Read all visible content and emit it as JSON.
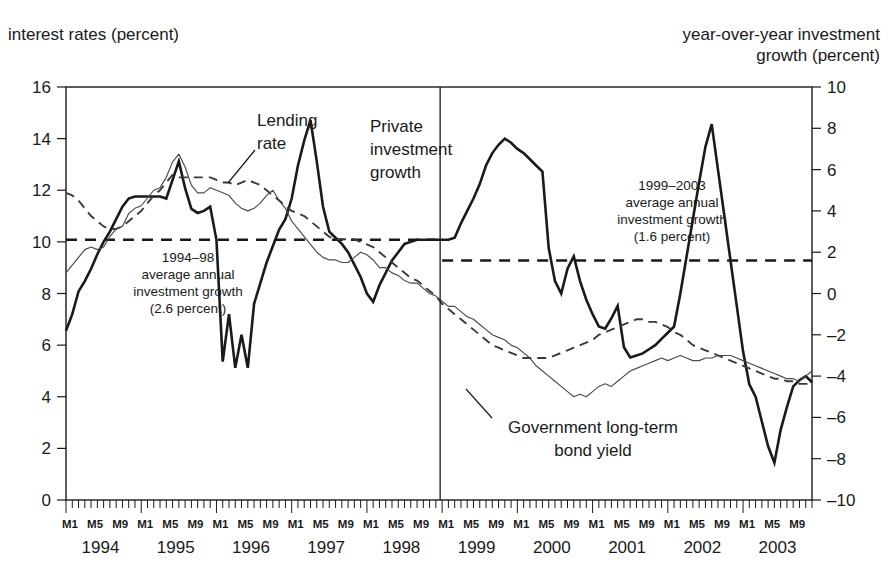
{
  "figure": {
    "title_partial": "",
    "left_axis_title": "interest rates (percent)",
    "right_axis_title": "year-over-year investment\ngrowth (percent)"
  },
  "chart_data": {
    "type": "line",
    "title": "",
    "xlabel": "",
    "ylabel": "interest rates (percent)",
    "y2label": "year-over-year investment growth (percent)",
    "ylim": [
      0,
      16
    ],
    "y2lim": [
      -10,
      10
    ],
    "yticks": [
      0,
      2,
      4,
      6,
      8,
      10,
      12,
      14,
      16
    ],
    "y2ticks": [
      -10,
      -8,
      -6,
      -4,
      -2,
      0,
      2,
      4,
      6,
      8,
      10
    ],
    "grid": false,
    "legend_position": "inline-annotations",
    "x_start": "1994-M1",
    "x_end": "2003-M12",
    "x_tick_interval_months": 1,
    "month_labels": [
      "M1",
      "M5",
      "M9"
    ],
    "years": [
      "1994",
      "1995",
      "1996",
      "1997",
      "1998",
      "1999",
      "2000",
      "2001",
      "2002",
      "2003"
    ],
    "divider_at": "1998-M12/1999-M1",
    "series": [
      {
        "name": "Private investment growth",
        "axis": "right",
        "style": "solid-thick",
        "label_text": "Private\ninvestment\ngrowth",
        "values": [
          -1.8,
          -1.0,
          0.1,
          0.6,
          1.2,
          1.9,
          2.5,
          3.0,
          3.6,
          4.2,
          4.6,
          4.7,
          4.7,
          4.7,
          4.7,
          4.7,
          4.6,
          5.5,
          6.4,
          5.1,
          4.1,
          3.9,
          4.0,
          4.2,
          2.6,
          -3.3,
          -1.0,
          -3.6,
          -2.0,
          -3.6,
          -0.5,
          0.5,
          1.5,
          2.3,
          3.1,
          3.6,
          4.6,
          6.2,
          7.4,
          8.4,
          6.4,
          4.2,
          3.0,
          2.7,
          2.4,
          2.0,
          1.4,
          0.8,
          0.0,
          -0.4,
          0.4,
          1.0,
          1.6,
          2.0,
          2.4,
          2.5,
          2.6,
          2.6,
          2.6,
          2.6,
          2.6,
          2.6,
          2.7,
          3.4,
          4.0,
          4.6,
          5.3,
          6.2,
          6.8,
          7.2,
          7.5,
          7.3,
          7.0,
          6.8,
          6.5,
          6.2,
          5.9,
          2.2,
          0.6,
          0.0,
          1.2,
          1.8,
          0.6,
          -0.3,
          -1.0,
          -1.6,
          -1.7,
          -1.2,
          -0.6,
          -2.6,
          -3.1,
          -3.0,
          -2.9,
          -2.7,
          -2.5,
          -2.2,
          -1.9,
          -1.6,
          0.0,
          1.8,
          3.6,
          5.4,
          7.1,
          8.2,
          6.0,
          3.8,
          1.6,
          -0.6,
          -2.8,
          -4.4,
          -5.0,
          -6.2,
          -7.4,
          -8.2,
          -6.6,
          -5.5,
          -4.5,
          -4.2,
          -4.0,
          -4.3
        ]
      },
      {
        "name": "Lending rate",
        "axis": "left",
        "style": "dashed",
        "label_text": "Lending\nrate",
        "values": [
          11.9,
          11.8,
          11.6,
          11.3,
          11.0,
          10.8,
          10.6,
          10.5,
          10.5,
          10.6,
          10.8,
          11.0,
          11.2,
          11.5,
          11.8,
          12.0,
          12.3,
          12.6,
          12.5,
          12.5,
          12.5,
          12.5,
          12.5,
          12.5,
          12.4,
          12.3,
          12.3,
          12.2,
          12.3,
          12.4,
          12.3,
          12.2,
          12.0,
          11.8,
          11.6,
          11.4,
          11.2,
          11.1,
          11.0,
          10.8,
          10.6,
          10.4,
          10.2,
          10.1,
          10.1,
          10.1,
          10.1,
          10.0,
          9.9,
          9.8,
          9.6,
          9.4,
          9.2,
          9.0,
          8.8,
          8.6,
          8.5,
          8.3,
          8.1,
          7.9,
          7.6,
          7.4,
          7.2,
          7.0,
          6.8,
          6.6,
          6.4,
          6.2,
          6.0,
          5.9,
          5.8,
          5.7,
          5.6,
          5.5,
          5.5,
          5.5,
          5.5,
          5.5,
          5.6,
          5.7,
          5.8,
          5.9,
          6.0,
          6.1,
          6.2,
          6.4,
          6.5,
          6.6,
          6.7,
          6.8,
          6.9,
          7.0,
          7.0,
          6.9,
          6.9,
          6.8,
          6.7,
          6.5,
          6.4,
          6.2,
          6.0,
          5.9,
          5.8,
          5.7,
          5.6,
          5.5,
          5.4,
          5.3,
          5.2,
          5.1,
          5.0,
          4.9,
          4.8,
          4.7,
          4.7,
          4.6,
          4.6,
          4.5,
          4.5,
          4.5
        ]
      },
      {
        "name": "Government long-term bond yield",
        "axis": "left",
        "style": "solid-thin",
        "label_text": "Government long-term\nbond yield",
        "values": [
          8.8,
          9.1,
          9.4,
          9.7,
          9.8,
          9.7,
          9.8,
          10.2,
          10.5,
          10.6,
          11.1,
          11.3,
          11.4,
          11.7,
          12.0,
          12.1,
          12.5,
          13.1,
          13.4,
          12.9,
          12.2,
          11.9,
          11.9,
          12.1,
          12.0,
          11.9,
          11.8,
          11.5,
          11.3,
          11.2,
          11.3,
          11.5,
          11.8,
          12.0,
          11.6,
          11.3,
          10.8,
          10.5,
          10.2,
          9.9,
          9.6,
          9.4,
          9.3,
          9.3,
          9.2,
          9.2,
          9.4,
          9.6,
          9.5,
          9.3,
          9.0,
          9.0,
          8.8,
          8.7,
          8.5,
          8.4,
          8.4,
          8.2,
          8.0,
          7.9,
          7.7,
          7.5,
          7.5,
          7.3,
          7.1,
          7.0,
          6.8,
          6.6,
          6.4,
          6.3,
          6.2,
          6.0,
          5.9,
          5.7,
          5.5,
          5.2,
          5.0,
          4.8,
          4.6,
          4.4,
          4.2,
          4.0,
          4.1,
          4.0,
          4.2,
          4.4,
          4.5,
          4.4,
          4.6,
          4.8,
          5.0,
          5.1,
          5.2,
          5.3,
          5.4,
          5.5,
          5.4,
          5.5,
          5.6,
          5.5,
          5.4,
          5.4,
          5.5,
          5.5,
          5.6,
          5.6,
          5.6,
          5.5,
          5.4,
          5.3,
          5.2,
          5.1,
          5.0,
          4.9,
          4.8,
          4.7,
          4.7,
          4.6,
          4.8,
          5.0
        ]
      }
    ],
    "reference_lines": [
      {
        "name": "1994-98 average annual investment growth",
        "axis": "right",
        "value": 2.6,
        "x_from": "1994-M1",
        "x_to": "1998-M12",
        "style": "dashed-thick",
        "label_lines": [
          "1994–98",
          "average annual",
          "investment growth",
          "(2.6 percent)"
        ]
      },
      {
        "name": "1999-2003 average annual investment growth",
        "axis": "right",
        "value": 1.6,
        "x_from": "1999-M1",
        "x_to": "2003-M12",
        "style": "dashed-thick",
        "label_lines": [
          "1999–2003",
          "average annual",
          "investment growth",
          "(1.6 percent)"
        ]
      }
    ],
    "annotations": [
      {
        "name": "lending-rate-label",
        "lines": [
          "Lending",
          "rate"
        ]
      },
      {
        "name": "private-investment-growth-label",
        "lines": [
          "Private",
          "investment",
          "growth"
        ]
      },
      {
        "name": "bond-yield-label",
        "lines": [
          "Government long-term",
          "bond yield"
        ]
      }
    ]
  }
}
